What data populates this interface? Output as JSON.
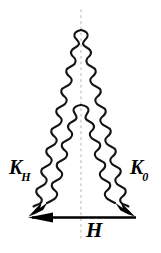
{
  "figure": {
    "type": "scattering-vector-diagram",
    "background_color": "#ffffff",
    "line_color": "#000000",
    "center_line_color": "#cfc8bb",
    "labels": {
      "incident_wave": {
        "base": "K",
        "subscript": "0"
      },
      "diffracted_wave": {
        "base": "K",
        "subscript": "H"
      },
      "reciprocal_vector": {
        "base": "H",
        "subscript": ""
      }
    },
    "elements": {
      "outer_triangle_name": "outer-wavy-triangle",
      "inner_triangle_name": "inner-wavy-triangle",
      "center_axis_name": "dotted-center-axis",
      "base_vector_name": "h-vector-arrow"
    },
    "geometry": {
      "outer_apex": [
        81,
        30
      ],
      "inner_apex": [
        81,
        105
      ],
      "left_foot": [
        30,
        212
      ],
      "right_foot": [
        133,
        212
      ],
      "baseline_y": 217,
      "baseline_x_start": 28,
      "baseline_x_end": 136,
      "axis_x": 81,
      "axis_y_top": 10,
      "axis_y_bottom": 241
    }
  }
}
